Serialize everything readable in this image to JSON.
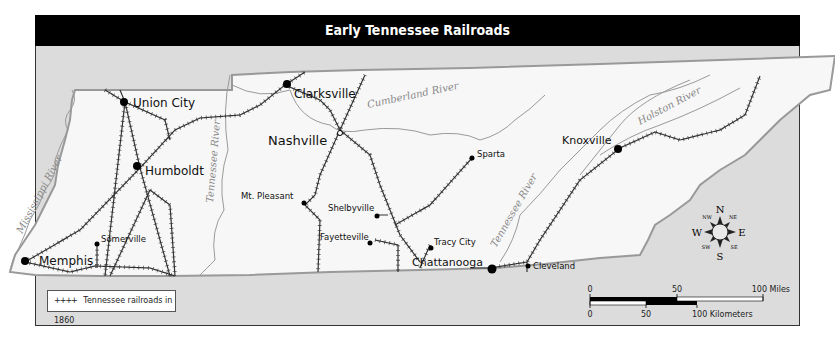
{
  "title": "Early Tennessee Railroads",
  "cities": [
    {
      "name": "Union City",
      "size": "large"
    },
    {
      "name": "Humboldt",
      "size": "large"
    },
    {
      "name": "Memphis",
      "size": "large"
    },
    {
      "name": "Somerville",
      "size": "small"
    },
    {
      "name": "Clarksville",
      "size": "large"
    },
    {
      "name": "Nashville",
      "size": "capital"
    },
    {
      "name": "Mt. Pleasant",
      "size": "small"
    },
    {
      "name": "Shelbyville",
      "size": "small"
    },
    {
      "name": "Fayetteville",
      "size": "small"
    },
    {
      "name": "Tracy City",
      "size": "small"
    },
    {
      "name": "Chattanooga",
      "size": "large"
    },
    {
      "name": "Cleveland",
      "size": "small"
    },
    {
      "name": "Sparta",
      "size": "small"
    },
    {
      "name": "Knoxville",
      "size": "large"
    }
  ],
  "rivers": [
    "Mississippi River",
    "Tennessee River",
    "Cumberland River",
    "Tennessee River",
    "Holston River"
  ],
  "legend": {
    "symbol": "++++",
    "label": "Tennessee railroads in 1860"
  },
  "compass": {
    "n": "N",
    "s": "S",
    "e": "E",
    "w": "W",
    "ne": "NE",
    "nw": "NW",
    "se": "SE",
    "sw": "SW"
  },
  "scale": {
    "miles": {
      "ticks": [
        "0",
        "50",
        "100 Miles"
      ]
    },
    "kilometers": {
      "ticks": [
        "0",
        "50",
        "100 Kilometers"
      ]
    }
  },
  "colors": {
    "background": "#dcdcdc",
    "state_fill": "#f7f7f7",
    "border": "#999999",
    "rail": "#333333",
    "river": "#888888",
    "title_bar": "#000000"
  }
}
